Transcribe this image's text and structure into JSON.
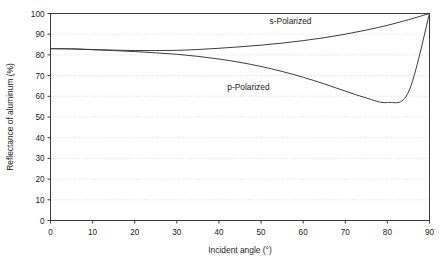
{
  "chart_data": {
    "type": "line",
    "title": "",
    "xlabel": "Incident angle (°)",
    "ylabel": "Reflectance of aluminum (%)",
    "xlim": [
      0,
      90
    ],
    "ylim": [
      0,
      100
    ],
    "xticks": [
      0,
      10,
      20,
      30,
      40,
      50,
      60,
      70,
      80,
      90
    ],
    "yticks": [
      0,
      10,
      20,
      30,
      40,
      50,
      60,
      70,
      80,
      90,
      100
    ],
    "grid": "horizontal-dotted",
    "legend": "inline-series-labels",
    "x": [
      0,
      5,
      10,
      15,
      20,
      25,
      30,
      35,
      40,
      45,
      50,
      55,
      60,
      65,
      70,
      75,
      80,
      85,
      90
    ],
    "series": [
      {
        "name": "s-Polarized",
        "label_x": 57,
        "label_y": 95,
        "values": [
          83.0,
          82.9,
          82.6,
          82.3,
          82.1,
          82.1,
          82.2,
          82.6,
          83.2,
          83.9,
          84.7,
          85.7,
          86.9,
          88.3,
          90.0,
          92.0,
          94.3,
          97.0,
          100.0
        ]
      },
      {
        "name": "p-Polarized",
        "label_x": 47,
        "label_y": 63,
        "values": [
          83.0,
          82.9,
          82.5,
          82.1,
          81.6,
          81.0,
          80.3,
          79.3,
          78.0,
          76.4,
          74.4,
          72.0,
          69.2,
          66.0,
          62.5,
          59.2,
          57.0,
          62.0,
          100.0
        ]
      }
    ],
    "ytick_labels": [
      "0",
      "10",
      "20",
      "30",
      "40",
      "50",
      "60",
      "70",
      "80",
      "90",
      "100"
    ],
    "xtick_labels": [
      "0",
      "10",
      "20",
      "30",
      "40",
      "50",
      "60",
      "70",
      "80",
      "90"
    ],
    "colors": {
      "curve": "#3d3d3d",
      "axis": "#3a3a3a",
      "grid": "#c9c9c9",
      "background": "#ffffff",
      "text": "#1a1a1a"
    }
  }
}
